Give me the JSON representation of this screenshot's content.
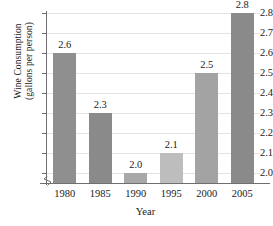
{
  "chart_data": {
    "type": "bar",
    "title": "",
    "xlabel": "Year",
    "ylabel_line1": "Wine Consumption",
    "ylabel_line2": "(gallons per person)",
    "categories": [
      "1980",
      "1985",
      "1990",
      "1995",
      "2000",
      "2005"
    ],
    "values": [
      2.6,
      2.3,
      2.0,
      2.1,
      2.5,
      2.8
    ],
    "value_labels": [
      "2.6",
      "2.3",
      "2.0",
      "2.1",
      "2.5",
      "2.8"
    ],
    "bar_colors": [
      "#8f8f8f",
      "#8a8a8a",
      "#a8a8a8",
      "#bdbdbd",
      "#a3a3a3",
      "#8a8a8a"
    ],
    "ylim": [
      1.95,
      2.8
    ],
    "yticks": [
      2.0,
      2.1,
      2.2,
      2.3,
      2.4,
      2.5,
      2.6,
      2.7,
      2.8
    ],
    "ytick_labels": [
      "2.0",
      "2.1",
      "2.2",
      "2.3",
      "2.4",
      "2.5",
      "2.6",
      "2.7",
      "2.8"
    ],
    "grid": true,
    "legend": "none",
    "axis_break": true,
    "axis_color": "#6f6f6f",
    "grid_color": "#e3e3e3"
  }
}
